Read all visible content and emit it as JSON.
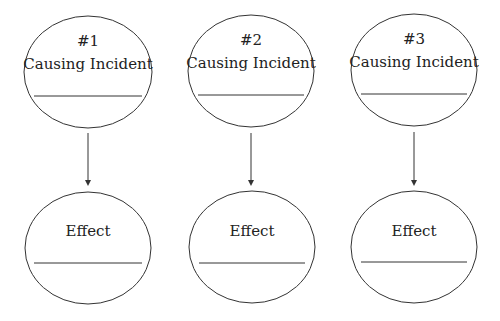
{
  "diagram": {
    "columns": [
      {
        "number": "#1",
        "cause_label": "Causing Incident",
        "effect_label": "Effect",
        "cx": 88
      },
      {
        "number": "#2",
        "cause_label": "Causing Incident",
        "effect_label": "Effect",
        "cx": 251
      },
      {
        "number": "#3",
        "cause_label": "Causing Incident",
        "effect_label": "Effect",
        "cx": 414
      }
    ],
    "stroke_color": "#333333",
    "background": "#ffffff"
  }
}
